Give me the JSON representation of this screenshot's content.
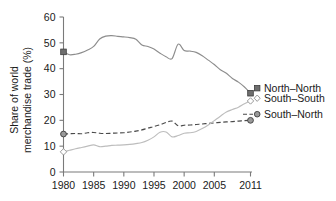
{
  "chart_data": {
    "type": "line",
    "title": "",
    "xlabel": "",
    "ylabel": "Share of world merchandise trade (%)",
    "ylabel_line1": "Share of world",
    "ylabel_line2": "merchandise trade (%)",
    "xlim": [
      1980,
      2011
    ],
    "ylim": [
      0,
      60
    ],
    "grid": false,
    "legend_position": "right",
    "xticks": [
      1980,
      1985,
      1990,
      1995,
      2000,
      2005,
      2011
    ],
    "xtick_labels": [
      "1980",
      "1985",
      "1990",
      "1995",
      "2000",
      "2005",
      "2011"
    ],
    "yticks": [
      0,
      10,
      20,
      30,
      40,
      50,
      60
    ],
    "ytick_labels": [
      "0",
      "10",
      "20",
      "30",
      "40",
      "50",
      "60"
    ],
    "x": [
      1980,
      1981,
      1982,
      1983,
      1984,
      1985,
      1986,
      1987,
      1988,
      1989,
      1990,
      1991,
      1992,
      1993,
      1994,
      1995,
      1996,
      1997,
      1998,
      1999,
      2000,
      2001,
      2002,
      2003,
      2004,
      2005,
      2006,
      2007,
      2008,
      2009,
      2010,
      2011
    ],
    "series": [
      {
        "name": "North-North",
        "label": "North–North",
        "color": "#8d8d8d",
        "style": "solid",
        "marker": "filled-square",
        "marker_years": [
          1980,
          2011
        ],
        "values": [
          46.5,
          45.4,
          45.6,
          46.2,
          47.2,
          48.6,
          51.5,
          52.6,
          52.8,
          52.5,
          52.3,
          52.0,
          51.4,
          49.2,
          48.6,
          47.6,
          46.0,
          44.6,
          43.9,
          49.5,
          47.0,
          46.8,
          46.3,
          45.0,
          43.3,
          41.6,
          39.6,
          38.2,
          36.2,
          34.8,
          32.9,
          30.5
        ]
      },
      {
        "name": "South-South",
        "label": "South–South",
        "color": "#bdbdbd",
        "style": "solid",
        "marker": "open-diamond",
        "marker_years": [
          1980,
          2011
        ],
        "values": [
          7.8,
          8.4,
          9.0,
          9.5,
          10.0,
          10.5,
          9.8,
          10.0,
          10.3,
          10.4,
          10.5,
          10.7,
          11.0,
          11.4,
          12.3,
          13.6,
          15.4,
          15.5,
          13.6,
          14.1,
          15.0,
          15.2,
          15.7,
          16.8,
          18.2,
          19.9,
          21.6,
          23.2,
          24.2,
          25.1,
          26.4,
          27.5
        ]
      },
      {
        "name": "South-North",
        "label": "South–North",
        "color": "#4a4a4a",
        "style": "dashed",
        "marker": "filled-circle",
        "marker_years": [
          1980,
          2011
        ],
        "values": [
          14.7,
          14.8,
          14.9,
          14.8,
          15.2,
          15.3,
          15.0,
          14.9,
          15.0,
          15.1,
          15.2,
          15.5,
          15.8,
          16.3,
          17.0,
          17.6,
          18.3,
          19.2,
          19.7,
          17.9,
          18.1,
          18.2,
          18.4,
          18.6,
          18.8,
          19.0,
          19.2,
          19.4,
          19.5,
          19.7,
          19.9,
          20.0
        ]
      }
    ],
    "legend": [
      {
        "label": "North–North",
        "marker": "filled-square",
        "color": "#8d8d8d"
      },
      {
        "label": "South–South",
        "marker": "open-diamond",
        "color": "#bdbdbd"
      },
      {
        "label": "South–North",
        "marker": "filled-circle",
        "color": "#4a4a4a"
      }
    ]
  }
}
